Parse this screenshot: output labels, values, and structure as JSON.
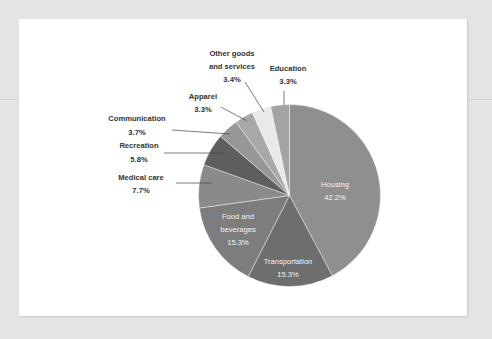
{
  "chart_data": {
    "type": "pie",
    "title": "",
    "start_angle": "12 o'clock, clockwise",
    "slices": [
      {
        "label": "Housing",
        "value": 42.2,
        "display": "42.2%",
        "color": "#8f8f8f"
      },
      {
        "label": "Transportation",
        "value": 15.3,
        "display": "15.3%",
        "color": "#6e6e6e"
      },
      {
        "label": "Food and beverages",
        "value": 15.3,
        "display": "15.3%",
        "color": "#7d7d7d"
      },
      {
        "label": "Medical care",
        "value": 7.7,
        "display": "7.7%",
        "color": "#8a8a8a"
      },
      {
        "label": "Recreation",
        "value": 5.8,
        "display": "5.8%",
        "color": "#5e5e5e"
      },
      {
        "label": "Communication",
        "value": 3.7,
        "display": "3.7%",
        "color": "#979797"
      },
      {
        "label": "Apparel",
        "value": 3.3,
        "display": "3.3%",
        "color": "#a8a8a8"
      },
      {
        "label": "Other goods and services",
        "value": 3.4,
        "display": "3.4%",
        "color": "#e9e9e9"
      },
      {
        "label": "Education",
        "value": 3.3,
        "display": "3.3%",
        "color": "#a3a3a3"
      }
    ]
  },
  "labels": {
    "housing": {
      "line1": "Housing",
      "pct": "42.2%"
    },
    "transportation": {
      "line1": "Transportation",
      "pct": "15.3%"
    },
    "food": {
      "line1": "Food and",
      "line2": "beverages",
      "pct": "15.3%"
    },
    "medical": {
      "line1": "Medical care",
      "pct": "7.7%"
    },
    "recreation": {
      "line1": "Recreation",
      "pct": "5.8%"
    },
    "communication": {
      "line1": "Communication",
      "pct": "3.7%"
    },
    "apparel": {
      "line1": "Apparel",
      "pct": "3.3%"
    },
    "other": {
      "line1": "Other goods",
      "line2": "and services",
      "pct": "3.4%"
    },
    "education": {
      "line1": "Education",
      "pct": "3.3%"
    }
  }
}
